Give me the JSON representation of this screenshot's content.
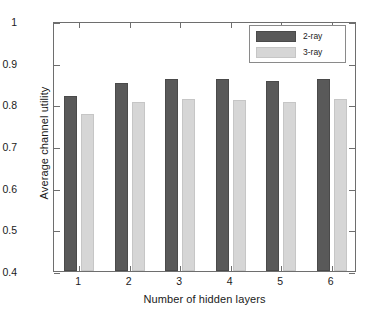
{
  "chart_data": {
    "type": "bar",
    "title": "",
    "subtitle": "",
    "xlabel": "Number of hidden layers",
    "ylabel": "Average channel utility",
    "categories": [
      "1",
      "2",
      "3",
      "4",
      "5",
      "6"
    ],
    "series": [
      {
        "name": "2-ray",
        "color": "#595959",
        "values": [
          0.82,
          0.852,
          0.862,
          0.86,
          0.855,
          0.86
        ]
      },
      {
        "name": "3-ray",
        "color": "#d6d6d6",
        "values": [
          0.776,
          0.805,
          0.813,
          0.811,
          0.806,
          0.812
        ]
      }
    ],
    "ylim": [
      0.4,
      1
    ],
    "ytick_values": [
      0.4,
      0.5,
      0.6,
      0.7,
      0.8,
      0.9,
      1
    ],
    "ytick_labels": [
      "0.4",
      "0.5",
      "0.6",
      "0.7",
      "0.8",
      "0.9",
      "1"
    ],
    "xtick_labels": [
      "1",
      "2",
      "3",
      "4",
      "5",
      "6"
    ],
    "grid": false,
    "legend_position": "top-right",
    "bar_group_style": "grouped"
  }
}
